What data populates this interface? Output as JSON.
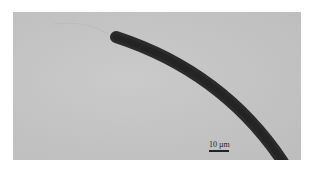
{
  "image": {
    "description": "Micrograph of a curved dark filament on a gray background",
    "background_color": "#c4c4c4",
    "filament_color": "#2a2a2a"
  },
  "scale_bar": {
    "label": "10 µm"
  }
}
